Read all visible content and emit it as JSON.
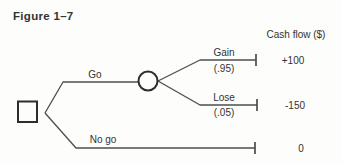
{
  "figure": {
    "title": "Figure 1–7",
    "column_header": "Cash flow ($)",
    "tree": {
      "decision_node_shape": "square",
      "chance_node_shape": "circle",
      "branches": {
        "go": {
          "label": "Go"
        },
        "gain": {
          "label": "Gain",
          "probability": "(.95)",
          "cash_flow": "+100"
        },
        "lose": {
          "label": "Lose",
          "probability": "(.05)",
          "cash_flow": "-150"
        },
        "no_go": {
          "label": "No go",
          "cash_flow": "0"
        }
      }
    }
  },
  "colors": {
    "background": "#fdfdfb",
    "line": "#4d4d4d",
    "node": "#2d2d2d",
    "text": "#333333"
  }
}
